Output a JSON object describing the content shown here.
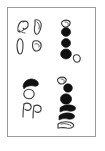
{
  "figure": {
    "panel_name": "specimen-plate",
    "background_color": "#ffffff",
    "frame_color": "#9a9a9a",
    "outline_color": "#3a3a3a",
    "fill_color": "#111111",
    "caption": "",
    "groups": [
      {
        "id": "top-left",
        "name": "outlined-specimen-cluster-upper-left",
        "style": "outline",
        "count": 4,
        "items": [
          {
            "name": "hooked-comma-outline",
            "label": ""
          },
          {
            "name": "hooked-comma-outline",
            "label": ""
          },
          {
            "name": "elongated-teardrop-outline",
            "label": ""
          },
          {
            "name": "rounded-blob-outline",
            "label": ""
          }
        ]
      },
      {
        "id": "top-right",
        "name": "filled-specimen-column-upper-right",
        "style": "filled",
        "count": 5,
        "items": [
          {
            "name": "small-comma-outline",
            "label": ""
          },
          {
            "name": "filled-round-dot",
            "label": ""
          },
          {
            "name": "filled-round-dot",
            "label": ""
          },
          {
            "name": "filled-round-dot-large",
            "label": ""
          },
          {
            "name": "small-circle-outline",
            "label": ""
          }
        ]
      },
      {
        "id": "bottom-left",
        "name": "outlined-specimen-cluster-lower-left",
        "style": "mixed",
        "count": 4,
        "items": [
          {
            "name": "filled-crescent-cap",
            "label": ""
          },
          {
            "name": "open-circle-outline",
            "label": ""
          },
          {
            "name": "looped-tail-outline",
            "label": ""
          },
          {
            "name": "looped-tail-outline",
            "label": ""
          }
        ]
      },
      {
        "id": "bottom-right",
        "name": "filled-specimen-column-lower-right",
        "style": "filled",
        "count": 6,
        "items": [
          {
            "name": "small-comma-outline",
            "label": ""
          },
          {
            "name": "filled-round-dot",
            "label": ""
          },
          {
            "name": "filled-round-dot-large",
            "label": ""
          },
          {
            "name": "filled-comma-tail",
            "label": ""
          },
          {
            "name": "filled-comma-tail",
            "label": ""
          },
          {
            "name": "outlined-comma-tail",
            "label": ""
          }
        ]
      }
    ]
  }
}
